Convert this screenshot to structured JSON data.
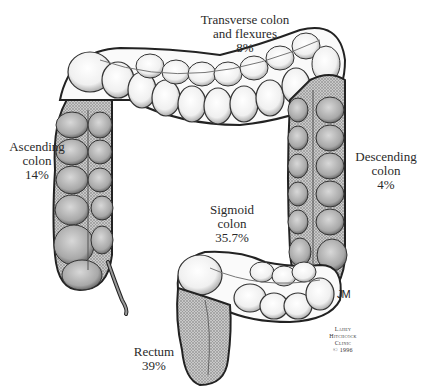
{
  "diagram": {
    "segments": [
      {
        "id": "transverse",
        "name_line1": "Transverse colon",
        "name_line2": "and flexures",
        "percent": "8%"
      },
      {
        "id": "ascending",
        "name_line1": "Ascending",
        "name_line2": "colon",
        "percent": "14%"
      },
      {
        "id": "descending",
        "name_line1": "Descending",
        "name_line2": "colon",
        "percent": "4%"
      },
      {
        "id": "sigmoid",
        "name_line1": "Sigmoid",
        "name_line2": "colon",
        "percent": "35.7%"
      },
      {
        "id": "rectum",
        "name_line1": "Rectum",
        "percent": "39%"
      }
    ],
    "signature": "JM",
    "credit": {
      "line1": "Lahey",
      "line2": "Hitchcock",
      "line3": "Clinic",
      "line4": "© 1996"
    }
  }
}
